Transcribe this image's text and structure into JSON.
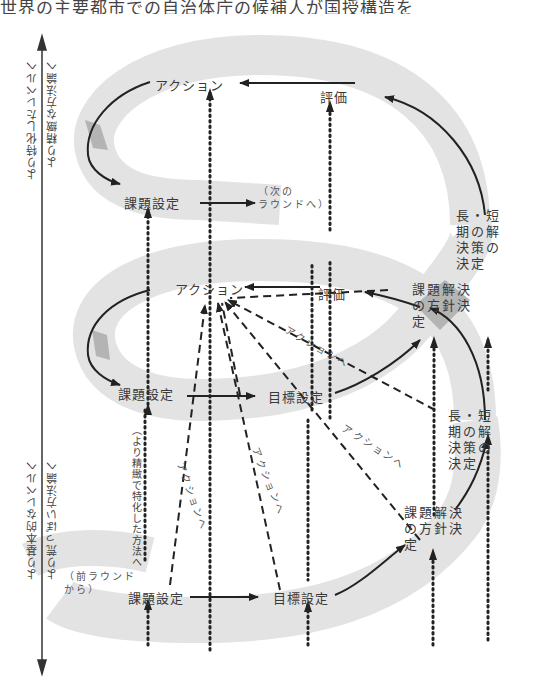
{
  "caption_top": "世界の主要都市での自治体庁の候補人が国授構造を",
  "axis": {
    "up_label_1": "より特化したレベルへ",
    "up_label_2": "より精緻な方法論へ",
    "down_label_1": "より基本的なレベルへ",
    "down_label_2": "より荒っぽい方法論へ"
  },
  "top_round": {
    "action": "アクション",
    "evaluation": "評価",
    "problem_setting": "課題設定",
    "next_round": "（次の\nラウンドへ）",
    "long_short_policy": "長・短期の解決策の決定"
  },
  "middle_round": {
    "action": "アクション",
    "evaluation": "評価",
    "policy_decision": "課題解決の方針決定",
    "problem_setting": "課題設定",
    "goal_setting": "目標設定",
    "long_short_policy": "長・短期の解決策の決定",
    "to_action_1": "アクションへ",
    "to_action_2": "アクションへ"
  },
  "bottom_round": {
    "from_prev_round": "（前ラウンド\nから）",
    "problem_setting": "課題設定",
    "goal_setting": "目標設定",
    "policy_decision": "課題解決の方針決定",
    "to_action_1": "アクションへ",
    "to_action_2": "アクションへ",
    "refine_note": "（より精緻で特化した方法へ"
  },
  "colors": {
    "band": "#e3e3e3",
    "band_dark": "#b4b4b4",
    "line": "#222222",
    "text": "#3a3a3a"
  }
}
